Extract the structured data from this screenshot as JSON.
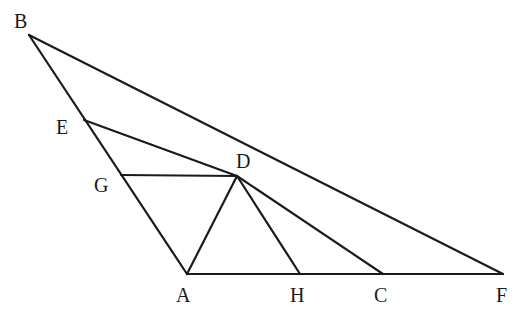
{
  "diagram": {
    "type": "geometry",
    "points": {
      "B": {
        "x": 29,
        "y": 35,
        "label": "B",
        "lx": 14,
        "ly": 28
      },
      "E": {
        "x": 84,
        "y": 120,
        "label": "E",
        "lx": 56,
        "ly": 134
      },
      "G": {
        "x": 121,
        "y": 175,
        "label": "G",
        "lx": 94,
        "ly": 192
      },
      "D": {
        "x": 237,
        "y": 176,
        "label": "D",
        "lx": 236,
        "ly": 168
      },
      "A": {
        "x": 187,
        "y": 274,
        "label": "A",
        "lx": 176,
        "ly": 302
      },
      "H": {
        "x": 300,
        "y": 274,
        "label": "H",
        "lx": 290,
        "ly": 302
      },
      "C": {
        "x": 383,
        "y": 274,
        "label": "C",
        "lx": 374,
        "ly": 302
      },
      "F": {
        "x": 503,
        "y": 274,
        "label": "F",
        "lx": 496,
        "ly": 302
      }
    },
    "segments": [
      [
        "B",
        "A"
      ],
      [
        "B",
        "F"
      ],
      [
        "A",
        "F"
      ],
      [
        "E",
        "D"
      ],
      [
        "G",
        "D"
      ],
      [
        "A",
        "D"
      ],
      [
        "D",
        "H"
      ],
      [
        "D",
        "C"
      ]
    ]
  }
}
